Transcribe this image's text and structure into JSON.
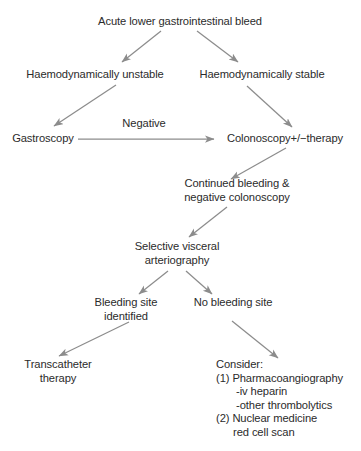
{
  "diagram": {
    "title_node": "Acute lower gastrointestinal bleed",
    "nodes": {
      "haemo_unstable": "Haemodynamically unstable",
      "haemo_stable": "Haemodynamically stable",
      "gastroscopy": "Gastroscopy",
      "colonoscopy": "Colonoscopy+/−therapy",
      "continued_bleeding": "Continued bleeding &\nnegative colonoscopy",
      "selective_arteriography": "Selective visceral\narteriography",
      "bleeding_site_identified": "Bleeding site\nidentified",
      "no_bleeding_site": "No bleeding site",
      "transcatheter": "Transcatheter\ntherapy"
    },
    "edge_labels": {
      "negative": "Negative"
    },
    "consider": {
      "heading": "Consider:",
      "items": [
        "(1) Pharmacoangiography",
        "-iv heparin",
        "-other thrombolytics",
        "(2) Nuclear medicine",
        "red cell scan"
      ]
    },
    "colors": {
      "arrow": "#8c8c8c",
      "text": "#2b2b2b",
      "background": "#ffffff"
    }
  }
}
